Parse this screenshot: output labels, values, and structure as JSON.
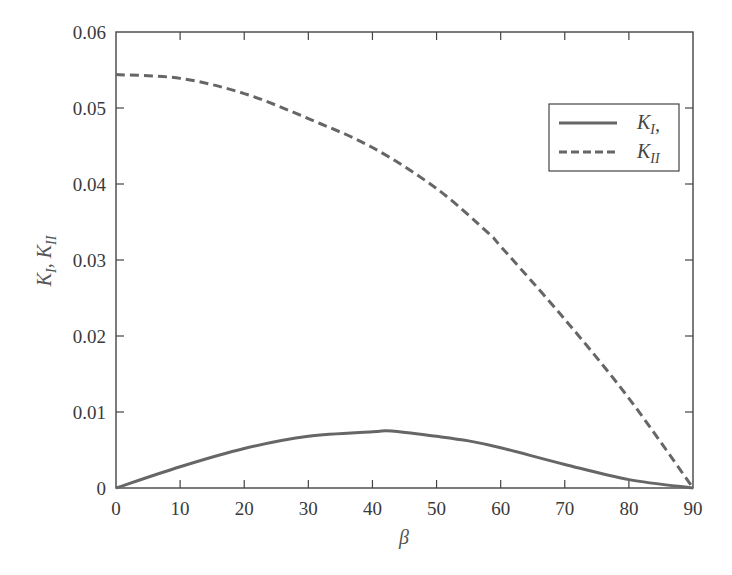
{
  "chart_data": {
    "type": "line",
    "title": "",
    "xlabel": "β",
    "ylabel": "K_I, K_II",
    "xlim": [
      0,
      90
    ],
    "ylim": [
      0,
      0.06
    ],
    "grid": false,
    "legend_position": "upper right",
    "x_ticks": [
      0,
      10,
      20,
      30,
      40,
      50,
      60,
      70,
      80,
      90
    ],
    "x_tick_labels": [
      "0",
      "10",
      "20",
      "30",
      "40",
      "50",
      "60",
      "70",
      "80",
      "90"
    ],
    "y_ticks": [
      0,
      0.01,
      0.02,
      0.03,
      0.04,
      0.05,
      0.06
    ],
    "y_tick_labels": [
      "0",
      "0.01",
      "0.02",
      "0.03",
      "0.04",
      "0.05",
      "0.06"
    ],
    "series": [
      {
        "name": "K_I,",
        "style": "solid",
        "color": "#666666",
        "x": [
          0,
          10,
          20,
          30,
          40,
          43,
          50,
          55,
          60,
          70,
          80,
          90
        ],
        "values": [
          0,
          0.0028,
          0.0052,
          0.0068,
          0.0074,
          0.0075,
          0.0068,
          0.0062,
          0.0053,
          0.0031,
          0.0011,
          0
        ]
      },
      {
        "name": "K_II",
        "style": "dashed",
        "color": "#666666",
        "x": [
          0,
          10,
          20,
          30,
          40,
          50,
          58,
          60,
          70,
          80,
          90
        ],
        "values": [
          0.0544,
          0.0539,
          0.0519,
          0.0486,
          0.0448,
          0.0394,
          0.0336,
          0.0318,
          0.0222,
          0.0118,
          0
        ]
      }
    ]
  },
  "axes": {
    "xlabel_symbol": "β",
    "ylabel_main": "K",
    "ylabel_sub1": "I",
    "ylabel_sep": ", K",
    "ylabel_sub2": "II"
  },
  "legend": {
    "items": [
      {
        "main": "K",
        "sub": "I",
        "suffix": ",",
        "style": "solid"
      },
      {
        "main": "K",
        "sub": "II",
        "suffix": "",
        "style": "dashed"
      }
    ]
  }
}
